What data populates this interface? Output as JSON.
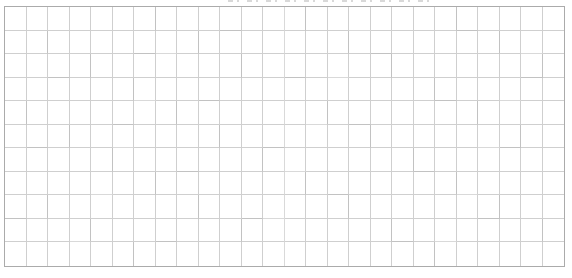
{
  "page": {
    "background_color": "#ffffff"
  },
  "clipped_title": {
    "visible_part": "bottom edge of cut-off text line",
    "remnant_color": "#b9b9b9"
  },
  "grid": {
    "rows": 11,
    "columns": 26,
    "cell_contents": [],
    "line_color": "#cfcfcf",
    "line_color_dark": "#c2c2c2",
    "line_color_light": "#d9d9d9",
    "border_color": "#ababab",
    "cell_background": "#ffffff"
  }
}
